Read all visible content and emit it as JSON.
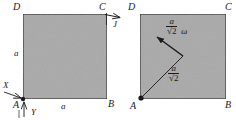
{
  "figure": {
    "colors": {
      "lamina_fill": "#a9a9a9",
      "outline": "#1a1a1a",
      "background": "#ffffff",
      "text": "#1a1a1a"
    }
  },
  "left_diagram": {
    "name": "before-impulse",
    "vertices": {
      "A": "A",
      "B": "B",
      "C": "C",
      "D": "D"
    },
    "side_label_left": "a",
    "side_label_bottom": "a",
    "impulse_label": "J",
    "reaction_x_label": "X",
    "reaction_y_label": "Y"
  },
  "right_diagram": {
    "name": "after-impulse",
    "vertices": {
      "A": "A",
      "B": "B",
      "C": "C",
      "D": "D"
    },
    "velocity": {
      "numerator": "a",
      "denominator": "√2",
      "omega": "ω"
    },
    "radius": {
      "numerator": "a",
      "denominator": "√2"
    }
  }
}
